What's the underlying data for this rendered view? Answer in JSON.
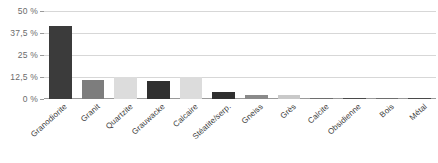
{
  "chart_data": {
    "type": "bar",
    "title": "",
    "subtitle": "",
    "xlabel": "",
    "ylabel": "",
    "ylim": [
      0,
      50
    ],
    "yunit": "%",
    "grid": true,
    "legend": "none",
    "ytick_labels": [
      "50 %",
      "37,5 %",
      "25 %",
      "12,5 %",
      "0 %"
    ],
    "ytick_values": [
      50,
      37.5,
      25,
      12.5,
      0
    ],
    "categories": [
      "Granodiorite",
      "Granit",
      "Quartzite",
      "Grauwacke",
      "Calcaire",
      "Stéatite/serp.",
      "Gneiss",
      "Grès",
      "Calcite",
      "Obsidienne",
      "Bois",
      "Métal"
    ],
    "values": [
      41.5,
      11.0,
      12.5,
      10.5,
      12.5,
      4.0,
      2.5,
      2.0,
      0.6,
      0.6,
      0.5,
      0.5
    ],
    "bar_colors": [
      "#3b3b3b",
      "#7d7d7d",
      "#dcdcdc",
      "#2f2f2f",
      "#dcdcdc",
      "#2f2f2f",
      "#8a8a8a",
      "#c9c9c9",
      "#6e6e6e",
      "#4a4a4a",
      "#6e6e6e",
      "#4a4a4a"
    ]
  },
  "colors": {
    "grid": "#d7d7d7",
    "axis": "#9a9a9a",
    "tick_text": "#6b6b6b",
    "category_text": "#3d3d3d",
    "background": "#ffffff"
  }
}
